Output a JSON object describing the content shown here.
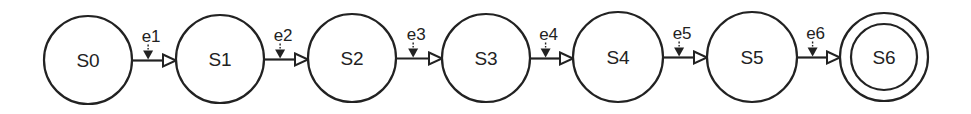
{
  "diagram": {
    "type": "state-machine",
    "direction": "left-to-right",
    "stroke_color": "#222222",
    "background": "#ffffff",
    "states": [
      {
        "id": "S0",
        "label": "S0",
        "cx": 88,
        "cy": 60,
        "r": 44,
        "accepting": false
      },
      {
        "id": "S1",
        "label": "S1",
        "cx": 220,
        "cy": 59,
        "r": 44,
        "accepting": false
      },
      {
        "id": "S2",
        "label": "S2",
        "cx": 352,
        "cy": 58,
        "r": 44,
        "accepting": false
      },
      {
        "id": "S3",
        "label": "S3",
        "cx": 486,
        "cy": 58,
        "r": 44,
        "accepting": false
      },
      {
        "id": "S4",
        "label": "S4",
        "cx": 618,
        "cy": 57,
        "r": 45,
        "accepting": false
      },
      {
        "id": "S5",
        "label": "S5",
        "cx": 752,
        "cy": 57,
        "r": 45,
        "accepting": false
      },
      {
        "id": "S6",
        "label": "S6",
        "cx": 884,
        "cy": 57,
        "r": 44,
        "inner_r": 33,
        "accepting": true
      }
    ],
    "transitions": [
      {
        "from": "S0",
        "to": "S1",
        "label": "e1"
      },
      {
        "from": "S1",
        "to": "S2",
        "label": "e2"
      },
      {
        "from": "S2",
        "to": "S3",
        "label": "e3"
      },
      {
        "from": "S3",
        "to": "S4",
        "label": "e4"
      },
      {
        "from": "S4",
        "to": "S5",
        "label": "e5"
      },
      {
        "from": "S5",
        "to": "S6",
        "label": "e6"
      }
    ]
  }
}
